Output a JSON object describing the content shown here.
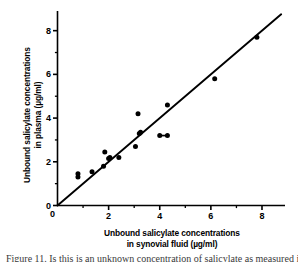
{
  "figure": {
    "kind": "scatter-plot-with-identity-line",
    "caption_partial": "Figure 11. Is this is an unknown concentration of salicylate as measured in"
  },
  "axes": {
    "y_title_line1": "Unbound salicylate concentrations",
    "y_title_line2": "in plasma (µg/ml)",
    "x_title_line1": "Unbound salicylate concentrations",
    "x_title_line2": "in synovial fluid (µg/ml)",
    "x_ticks": [
      "0",
      "2",
      "4",
      "6",
      "8"
    ],
    "y_ticks": [
      "0",
      "2",
      "4",
      "6",
      "8"
    ]
  },
  "chart_data": {
    "type": "scatter",
    "title": "",
    "xlabel": "Unbound salicylate concentrations in synovial fluid (µg/ml)",
    "ylabel": "Unbound salicylate concentrations in plasma (µg/ml)",
    "xlim": [
      0,
      8.9
    ],
    "ylim": [
      0,
      8.9
    ],
    "xticks": [
      0,
      2,
      4,
      6,
      8
    ],
    "yticks": [
      0,
      2,
      4,
      6,
      8
    ],
    "xminorticks": [
      1,
      3,
      5,
      7
    ],
    "yminorticks": [
      1,
      3,
      5,
      7
    ],
    "grid": false,
    "legend": null,
    "marker": "filled-circle",
    "marker_color": "#000000",
    "series": [
      {
        "name": "plasma vs synovial fluid",
        "x": [
          0.8,
          0.8,
          1.35,
          1.8,
          1.85,
          2.0,
          2.05,
          2.4,
          3.05,
          3.15,
          3.2,
          3.25,
          4.0,
          4.3,
          4.3,
          6.15,
          7.8
        ],
        "y": [
          1.3,
          1.45,
          1.55,
          1.8,
          2.45,
          2.15,
          2.2,
          2.2,
          2.7,
          4.2,
          3.3,
          3.35,
          3.2,
          3.2,
          4.6,
          5.8,
          7.7
        ]
      }
    ],
    "connectors": [
      {
        "x1": 4.0,
        "y1": 3.2,
        "x2": 4.3,
        "y2": 3.2
      }
    ],
    "reference_line": {
      "kind": "line-of-identity",
      "slope": 1.0,
      "intercept": 0.0,
      "x_from": 0.0,
      "x_to": 8.75,
      "color": "#000000"
    }
  }
}
